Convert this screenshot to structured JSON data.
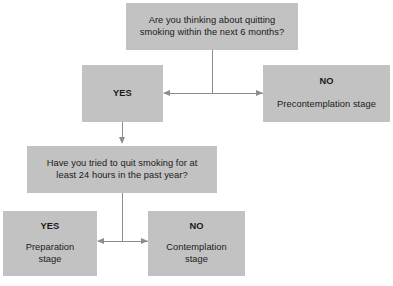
{
  "diagram": {
    "box_fill_color": "#c2c2c2",
    "connector_color": "#8d8d8d",
    "text_color": "#1a1a1a",
    "nodes": {
      "question_1": {
        "text": "Are you thinking about quitting\nsmoking within the next 6 months?"
      },
      "q1_yes": {
        "label": "YES",
        "stage": ""
      },
      "q1_no": {
        "label": "NO",
        "stage": "Precontemplation stage"
      },
      "question_2": {
        "text": "Have you tried to quit smoking for at\nleast 24 hours in the past year?"
      },
      "q2_yes": {
        "label": "YES",
        "stage": "Preparation\nstage"
      },
      "q2_no": {
        "label": "NO",
        "stage": "Contemplation\nstage"
      }
    }
  }
}
